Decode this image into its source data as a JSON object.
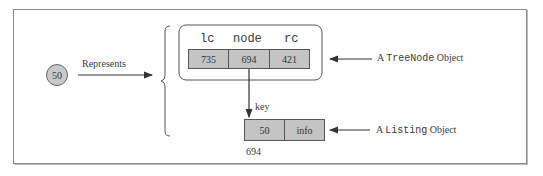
{
  "diagram": {
    "value_circle": "50",
    "represents_label": "Represents",
    "treenode": {
      "headers": [
        "lc",
        "node",
        "rc"
      ],
      "values": [
        "735",
        "694",
        "421"
      ],
      "label_prefix": "A ",
      "label_class": "TreeNode",
      "label_suffix": " Object"
    },
    "pointer_label": "key",
    "listing": {
      "fields": [
        "50",
        "info"
      ],
      "address": "694",
      "label_prefix": "A ",
      "label_class": "Listing",
      "label_suffix": " Object"
    }
  }
}
